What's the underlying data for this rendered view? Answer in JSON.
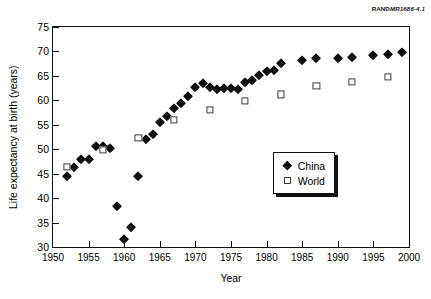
{
  "credit": {
    "prefix": "RAND",
    "code": "MR1686-4.1"
  },
  "chart_data": {
    "type": "scatter",
    "title": "",
    "xlabel": "Year",
    "ylabel": "Life expectancy at birth (years)",
    "xlim": [
      1950,
      2000
    ],
    "ylim": [
      30,
      75
    ],
    "xticks": [
      1950,
      1955,
      1960,
      1965,
      1970,
      1975,
      1980,
      1985,
      1990,
      1995,
      2000
    ],
    "yticks": [
      30,
      35,
      40,
      45,
      50,
      55,
      60,
      65,
      70,
      75
    ],
    "grid": false,
    "legend_position": "lower right",
    "series": [
      {
        "name": "China",
        "marker": "filled-diamond",
        "color": "#0d0d0d",
        "points": [
          [
            1952,
            44.6
          ],
          [
            1953,
            46.3
          ],
          [
            1954,
            48.0
          ],
          [
            1955,
            48.0
          ],
          [
            1956,
            50.6
          ],
          [
            1957,
            50.6
          ],
          [
            1958,
            50.2
          ],
          [
            1959,
            38.3
          ],
          [
            1960,
            31.7
          ],
          [
            1961,
            34.1
          ],
          [
            1962,
            44.6
          ],
          [
            1963,
            52.0
          ],
          [
            1964,
            53.2
          ],
          [
            1965,
            55.6
          ],
          [
            1966,
            56.7
          ],
          [
            1967,
            58.4
          ],
          [
            1968,
            59.5
          ],
          [
            1969,
            60.9
          ],
          [
            1970,
            62.7
          ],
          [
            1971,
            63.6
          ],
          [
            1972,
            62.8
          ],
          [
            1973,
            62.4
          ],
          [
            1974,
            62.6
          ],
          [
            1975,
            62.6
          ],
          [
            1976,
            62.3
          ],
          [
            1977,
            63.8
          ],
          [
            1978,
            64.1
          ],
          [
            1979,
            65.1
          ],
          [
            1980,
            66.1
          ],
          [
            1981,
            66.3
          ],
          [
            1982,
            67.7
          ],
          [
            1985,
            68.3
          ],
          [
            1987,
            68.6
          ],
          [
            1990,
            68.6
          ],
          [
            1992,
            68.9
          ],
          [
            1995,
            69.3
          ],
          [
            1997,
            69.5
          ],
          [
            1999,
            69.9
          ]
        ]
      },
      {
        "name": "World",
        "marker": "open-square",
        "color": "#3b3b3b",
        "points": [
          [
            1952,
            46.3
          ],
          [
            1957,
            49.9
          ],
          [
            1962,
            52.3
          ],
          [
            1967,
            56.0
          ],
          [
            1972,
            58.0
          ],
          [
            1977,
            59.8
          ],
          [
            1982,
            61.2
          ],
          [
            1987,
            63.0
          ],
          [
            1992,
            63.8
          ],
          [
            1997,
            64.8
          ]
        ]
      }
    ]
  }
}
